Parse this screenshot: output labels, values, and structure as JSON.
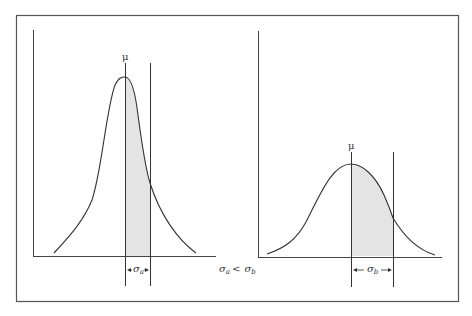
{
  "figure": {
    "comparison_label": "σa < σb",
    "comparison": {
      "left": "σ",
      "left_sub": "a",
      "op": "<",
      "right": "σ",
      "right_sub": "b"
    },
    "colors": {
      "line": "#3a3a3a",
      "shade": "#e6e6e6",
      "frame": "#555555"
    }
  },
  "left_panel": {
    "mean_label": "μ",
    "sigma_label": "σ",
    "sigma_sub": "a",
    "shape": "narrow-tall"
  },
  "right_panel": {
    "mean_label": "μ",
    "sigma_label": "σ",
    "sigma_sub": "b",
    "shape": "wide-short"
  }
}
